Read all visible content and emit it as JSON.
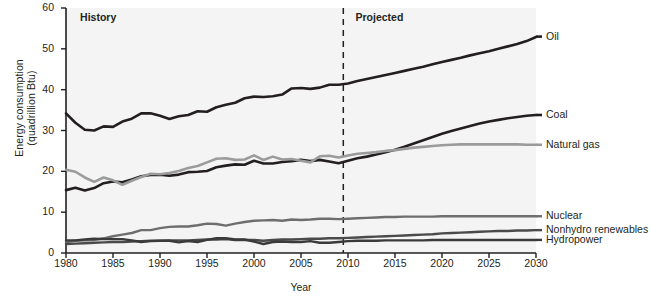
{
  "chart_data": {
    "type": "line",
    "title": "",
    "xlabel": "Year",
    "ylabel": "Energy consumption (quadrillion Btu)",
    "ylabel_line1": "Energy consumption",
    "ylabel_line2": "(quadrillion Btu)",
    "xlim": [
      1980,
      2030
    ],
    "ylim": [
      0,
      60
    ],
    "ytick_values": [
      0,
      10,
      20,
      30,
      40,
      50,
      60
    ],
    "ytick_labels": [
      "0",
      "10",
      "20",
      "30",
      "40",
      "50",
      "60"
    ],
    "xtick_values": [
      1980,
      1985,
      1990,
      1995,
      2000,
      2005,
      2010,
      2015,
      2020,
      2025,
      2030
    ],
    "xtick_labels": [
      "1980",
      "1985",
      "1990",
      "1995",
      "2000",
      "2005",
      "2010",
      "2015",
      "2020",
      "2025",
      "2030"
    ],
    "grid": false,
    "legend_position": "right-inline",
    "plot_background": "#f4f4f4",
    "annotations": [
      {
        "name": "history",
        "text": "History",
        "year": 1981.5,
        "value": 57.5
      },
      {
        "name": "projected",
        "text": "Projected",
        "year": 2010.8,
        "value": 57.5
      }
    ],
    "divider": {
      "name": "projection-divider",
      "year": 2009.5,
      "style": "dashed",
      "color": "#231f20"
    },
    "x": [
      1980,
      1981,
      1982,
      1983,
      1984,
      1985,
      1986,
      1987,
      1988,
      1989,
      1990,
      1991,
      1992,
      1993,
      1994,
      1995,
      1996,
      1997,
      1998,
      1999,
      2000,
      2001,
      2002,
      2003,
      2004,
      2005,
      2006,
      2007,
      2008,
      2009,
      2010,
      2011,
      2012,
      2013,
      2014,
      2015,
      2016,
      2017,
      2018,
      2019,
      2020,
      2021,
      2022,
      2023,
      2024,
      2025,
      2026,
      2027,
      2028,
      2029,
      2030
    ],
    "series": [
      {
        "name": "Oil",
        "color": "#231f20",
        "width": 2.6,
        "label": "Oil",
        "label_value": 53.0,
        "values": [
          34.2,
          31.9,
          30.2,
          30.0,
          31.0,
          30.9,
          32.2,
          32.9,
          34.2,
          34.2,
          33.6,
          32.8,
          33.5,
          33.8,
          34.7,
          34.6,
          35.7,
          36.3,
          36.8,
          37.9,
          38.3,
          38.2,
          38.4,
          38.8,
          40.3,
          40.4,
          40.2,
          40.5,
          41.2,
          41.2,
          41.5,
          42.1,
          42.6,
          43.1,
          43.6,
          44.1,
          44.6,
          45.1,
          45.6,
          46.2,
          46.8,
          47.3,
          47.8,
          48.4,
          48.9,
          49.4,
          50.0,
          50.6,
          51.2,
          51.9,
          52.9
        ]
      },
      {
        "name": "Coal",
        "color": "#231f20",
        "width": 2.6,
        "label": "Coal",
        "label_value": 33.8,
        "values": [
          15.4,
          16.0,
          15.3,
          15.9,
          17.1,
          17.5,
          17.3,
          18.0,
          18.8,
          19.1,
          19.2,
          18.9,
          19.2,
          19.8,
          19.9,
          20.1,
          21.0,
          21.4,
          21.7,
          21.6,
          22.6,
          21.9,
          21.9,
          22.3,
          22.5,
          22.8,
          22.5,
          22.8,
          22.4,
          22.0,
          22.6,
          23.2,
          23.6,
          24.1,
          24.7,
          25.3,
          26.0,
          26.8,
          27.6,
          28.4,
          29.2,
          29.9,
          30.5,
          31.1,
          31.7,
          32.2,
          32.6,
          33.0,
          33.3,
          33.6,
          33.8
        ]
      },
      {
        "name": "Natural gas",
        "color": "#9b9b9b",
        "width": 2.6,
        "label": "Natural gas",
        "label_value": 26.5,
        "values": [
          20.4,
          19.9,
          18.5,
          17.4,
          18.5,
          17.8,
          16.7,
          17.7,
          18.6,
          19.4,
          19.3,
          19.6,
          20.1,
          20.8,
          21.3,
          22.2,
          23.1,
          23.2,
          22.8,
          22.9,
          23.9,
          22.8,
          23.6,
          22.9,
          23.0,
          22.6,
          22.2,
          23.7,
          23.8,
          23.4,
          23.9,
          24.3,
          24.5,
          24.7,
          25.0,
          25.2,
          25.5,
          25.8,
          26.0,
          26.2,
          26.4,
          26.5,
          26.6,
          26.6,
          26.6,
          26.6,
          26.6,
          26.6,
          26.6,
          26.5,
          26.5
        ]
      },
      {
        "name": "Nuclear",
        "color": "#6e6e6e",
        "width": 2.4,
        "label": "Nuclear",
        "label_value": 9.0,
        "values": [
          2.7,
          3.0,
          3.1,
          3.2,
          3.6,
          4.1,
          4.5,
          4.9,
          5.6,
          5.6,
          6.1,
          6.4,
          6.5,
          6.5,
          6.8,
          7.2,
          7.1,
          6.7,
          7.2,
          7.6,
          7.9,
          8.0,
          8.1,
          7.9,
          8.2,
          8.1,
          8.2,
          8.4,
          8.4,
          8.3,
          8.4,
          8.5,
          8.6,
          8.7,
          8.8,
          8.8,
          8.9,
          8.9,
          8.9,
          8.9,
          9.0,
          9.0,
          9.0,
          9.0,
          9.0,
          9.0,
          9.0,
          9.0,
          9.0,
          9.0,
          9.0
        ]
      },
      {
        "name": "Nonhydro renewables",
        "color": "#4a4a4a",
        "width": 2.4,
        "label": "Nonhydro renewables",
        "label_value": 5.6,
        "values": [
          2.2,
          2.3,
          2.4,
          2.5,
          2.6,
          2.7,
          2.7,
          2.8,
          2.9,
          3.0,
          3.0,
          3.1,
          3.1,
          3.1,
          3.2,
          3.3,
          3.3,
          3.4,
          3.2,
          3.2,
          3.2,
          3.0,
          3.2,
          3.3,
          3.3,
          3.4,
          3.5,
          3.5,
          3.6,
          3.6,
          3.7,
          3.8,
          3.9,
          4.0,
          4.1,
          4.2,
          4.3,
          4.4,
          4.5,
          4.6,
          4.8,
          4.9,
          5.0,
          5.1,
          5.2,
          5.3,
          5.4,
          5.4,
          5.5,
          5.5,
          5.6
        ]
      },
      {
        "name": "Hydropower",
        "color": "#3a3a3a",
        "width": 2.4,
        "label": "Hydropower",
        "label_value": 3.2,
        "values": [
          3.1,
          3.1,
          3.3,
          3.5,
          3.4,
          3.4,
          3.4,
          3.1,
          2.7,
          2.9,
          3.0,
          3.0,
          2.6,
          2.9,
          2.7,
          3.2,
          3.6,
          3.6,
          3.3,
          3.3,
          2.8,
          2.2,
          2.7,
          2.8,
          2.7,
          2.7,
          2.9,
          2.5,
          2.5,
          2.7,
          2.9,
          3.0,
          3.0,
          3.0,
          3.1,
          3.1,
          3.1,
          3.1,
          3.1,
          3.2,
          3.2,
          3.2,
          3.2,
          3.2,
          3.2,
          3.2,
          3.2,
          3.2,
          3.2,
          3.2,
          3.2
        ]
      }
    ]
  }
}
